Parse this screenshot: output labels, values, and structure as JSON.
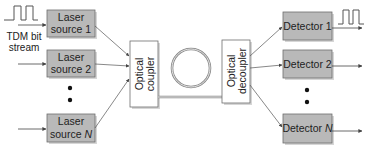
{
  "diagram": {
    "colors": {
      "source_fill": "#b9b9b9",
      "source_stroke": "#6e6e6e",
      "shadow": "#d6d6d6",
      "coupler_fill": "#ffffff",
      "line": "#555555",
      "text": "#222222"
    },
    "input_label": {
      "line1": "TDM bit",
      "line2": "stream"
    },
    "sources": [
      {
        "line1": "Laser",
        "line2": "source 1"
      },
      {
        "line1": "Laser",
        "line2": "source 2"
      },
      {
        "line1": "Laser",
        "line2": "source ",
        "italic_suffix": "N"
      }
    ],
    "coupler": {
      "line1": "Optical",
      "line2": "coupler"
    },
    "decoupler": {
      "line1": "Optical",
      "line2": "decoupler"
    },
    "detectors": [
      {
        "label": "Detector 1"
      },
      {
        "label": "Detector 2"
      },
      {
        "label": "Detector ",
        "italic_suffix": "N"
      }
    ],
    "ellipsis_symbol": "•"
  }
}
